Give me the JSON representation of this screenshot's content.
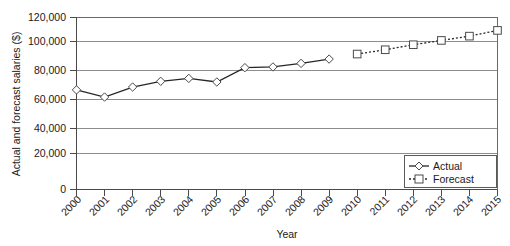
{
  "chart_data": {
    "type": "line",
    "title": "",
    "xlabel": "Year",
    "ylabel": "Actual and forecast salaries ($)",
    "categories": [
      "2000",
      "2001",
      "2002",
      "2003",
      "2004",
      "2005",
      "2006",
      "2007",
      "2008",
      "2009",
      "2010",
      "2011",
      "2012",
      "2013",
      "2014",
      "2015"
    ],
    "x": [
      2000,
      2001,
      2002,
      2003,
      2004,
      2005,
      2006,
      2007,
      2008,
      2009,
      2010,
      2011,
      2012,
      2013,
      2014,
      2015
    ],
    "ylim": [
      0,
      120000
    ],
    "xlim": [
      2000,
      2015
    ],
    "ytick_labels": [
      "0",
      "20,000",
      "40,000",
      "60,000",
      "80,000",
      "100,000",
      "120,000"
    ],
    "ytick_values": [
      0,
      20000,
      40000,
      60000,
      80000,
      100000,
      120000
    ],
    "grid": true,
    "grid_axis": "y",
    "legend_position": "bottom-right",
    "series": [
      {
        "name": "Actual",
        "marker": "diamond",
        "linestyle": "solid",
        "color": "#262626",
        "x": [
          2000,
          2001,
          2002,
          2003,
          2004,
          2005,
          2006,
          2007,
          2008,
          2009
        ],
        "values": [
          69500,
          64500,
          71500,
          75500,
          77500,
          75000,
          85000,
          85500,
          88000,
          91000
        ]
      },
      {
        "name": "Forecast",
        "marker": "square",
        "linestyle": "dotted",
        "color": "#262626",
        "x": [
          2010,
          2011,
          2012,
          2013,
          2014,
          2015
        ],
        "values": [
          94500,
          97500,
          101000,
          104000,
          107000,
          111000
        ]
      }
    ]
  },
  "legend": {
    "entries": [
      {
        "label": "Actual"
      },
      {
        "label": "Forecast"
      }
    ]
  },
  "axes": {
    "y_title": "Actual and forecast salaries ($)",
    "x_title": "Year"
  }
}
